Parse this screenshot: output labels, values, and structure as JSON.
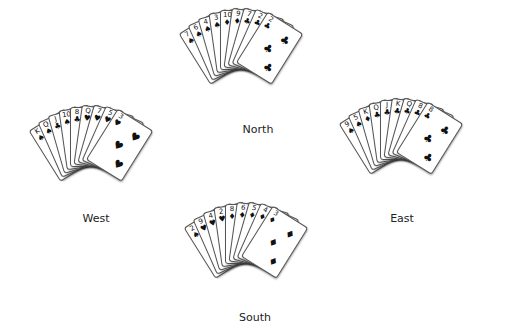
{
  "hands": [
    {
      "name": "North",
      "cx": 240,
      "cy": 68,
      "lx": 258,
      "ly": 123,
      "cards": [
        {
          "r": "7",
          "s": "♠"
        },
        {
          "r": "6",
          "s": "♠"
        },
        {
          "r": "4",
          "s": "♠"
        },
        {
          "r": "3",
          "s": "♠"
        },
        {
          "r": "10",
          "s": "♦"
        },
        {
          "r": "9",
          "s": "♦"
        },
        {
          "r": "7",
          "s": "♣"
        },
        {
          "r": "2",
          "s": "♣"
        },
        {
          "r": "2",
          "s": "♣"
        }
      ]
    },
    {
      "name": "West",
      "cx": 90,
      "cy": 165,
      "lx": 96,
      "ly": 212,
      "cards": [
        {
          "r": "K",
          "s": "♠"
        },
        {
          "r": "Q",
          "s": "♠"
        },
        {
          "r": "J",
          "s": "♣"
        },
        {
          "r": "10",
          "s": "♠"
        },
        {
          "r": "8",
          "s": "♣"
        },
        {
          "r": "Q",
          "s": "♥"
        },
        {
          "r": "7",
          "s": "♥"
        },
        {
          "r": "5",
          "s": "♥"
        },
        {
          "r": "3",
          "s": "♥"
        }
      ]
    },
    {
      "name": "East",
      "cx": 400,
      "cy": 158,
      "lx": 402,
      "ly": 212,
      "cards": [
        {
          "r": "9",
          "s": "♠"
        },
        {
          "r": "5",
          "s": "♠"
        },
        {
          "r": "K",
          "s": "♦"
        },
        {
          "r": "Q",
          "s": "♣"
        },
        {
          "r": "J",
          "s": "♣"
        },
        {
          "r": "K",
          "s": "♣"
        },
        {
          "r": "Q",
          "s": "♣"
        },
        {
          "r": "8",
          "s": "♣"
        },
        {
          "r": "8",
          "s": "♣"
        }
      ]
    },
    {
      "name": "South",
      "cx": 245,
      "cy": 262,
      "lx": 255,
      "ly": 311,
      "cards": [
        {
          "r": "2",
          "s": "♠"
        },
        {
          "r": "9",
          "s": "♥"
        },
        {
          "r": "4",
          "s": "♥"
        },
        {
          "r": "2",
          "s": "♥"
        },
        {
          "r": "8",
          "s": "♦"
        },
        {
          "r": "6",
          "s": "♦"
        },
        {
          "r": "5",
          "s": "♦"
        },
        {
          "r": "4",
          "s": "♦"
        },
        {
          "r": "3",
          "s": "♦"
        }
      ]
    }
  ]
}
